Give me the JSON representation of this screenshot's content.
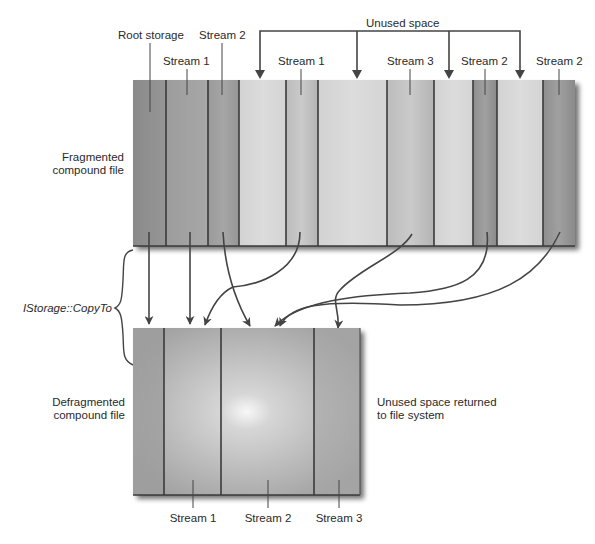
{
  "labels": {
    "root_storage": "Root storage",
    "unused_space": "Unused space",
    "fragmented": [
      "Fragmented",
      "compound file"
    ],
    "defragmented": [
      "Defragmented",
      "compound file"
    ],
    "copy_to": "IStorage::CopyTo",
    "returned": [
      "Unused space returned",
      "to file system"
    ]
  },
  "fragmented_file": {
    "segments": [
      {
        "name": "Root storage",
        "kind": "root",
        "label": ""
      },
      {
        "name": "Stream 1",
        "kind": "stream1",
        "label": "Stream 1"
      },
      {
        "name": "Stream 2",
        "kind": "stream2",
        "label": "Stream 2"
      },
      {
        "name": "Unused",
        "kind": "unused",
        "label": ""
      },
      {
        "name": "Stream 1",
        "kind": "stream1",
        "label": "Stream 1"
      },
      {
        "name": "Unused",
        "kind": "unused",
        "label": ""
      },
      {
        "name": "Stream 3",
        "kind": "stream3",
        "label": "Stream 3"
      },
      {
        "name": "Unused",
        "kind": "unused",
        "label": ""
      },
      {
        "name": "Stream 2",
        "kind": "stream2",
        "label": "Stream 2"
      },
      {
        "name": "Unused",
        "kind": "unused",
        "label": ""
      },
      {
        "name": "Stream 2",
        "kind": "stream2",
        "label": "Stream 2"
      }
    ]
  },
  "defragmented_file": {
    "segments": [
      {
        "name": "Root storage",
        "kind": "root",
        "label": ""
      },
      {
        "name": "Stream 1",
        "kind": "stream1",
        "label": "Stream 1"
      },
      {
        "name": "Stream 2",
        "kind": "stream2",
        "label": "Stream 2"
      },
      {
        "name": "Stream 3",
        "kind": "stream3",
        "label": "Stream 3"
      }
    ]
  },
  "colors": {
    "root": "#8e8e8e",
    "stream1": "#a4a4a4",
    "stream2": "#9a9a9a",
    "stream3": "#bcbcbc",
    "unused": "#d6d6d6",
    "defrag_base": "#a8a8a8",
    "divider": "#3a3a3a",
    "text": "#2a2a2a"
  }
}
